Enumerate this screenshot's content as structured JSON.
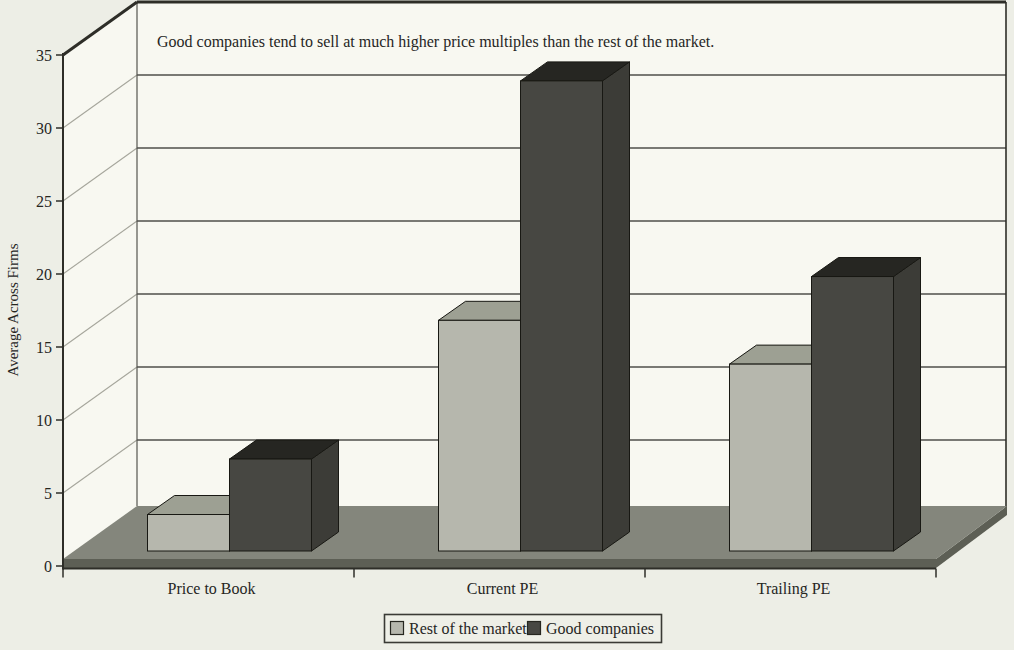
{
  "chart_data": {
    "type": "bar",
    "variant": "3d-clustered-column",
    "title": "Good companies tend to sell at much higher price multiples than the rest of the market.",
    "ylabel": "Average Across Firms",
    "xlabel": "",
    "categories": [
      "Price to Book",
      "Current PE",
      "Trailing PE"
    ],
    "series": [
      {
        "name": "Rest of the market",
        "values": [
          2.5,
          15.8,
          12.8
        ],
        "color_front": "#b6b7ad",
        "color_top": "#9da093",
        "color_side": "#8f9287"
      },
      {
        "name": "Good companies",
        "values": [
          6.3,
          32.2,
          18.8
        ],
        "color_front": "#474742",
        "color_top": "#262622",
        "color_side": "#3c3c37"
      }
    ],
    "ylim": [
      0,
      35
    ],
    "ytick_step": 5,
    "yticks": [
      0,
      5,
      10,
      15,
      20,
      25,
      30,
      35
    ],
    "grid": true,
    "legend_position": "bottom"
  },
  "colors": {
    "background": "#edeee6",
    "wall": "#f8f8f1",
    "gridline": "#4f4f4a",
    "wall_diagonal": "#a6a69c",
    "wall_edge": "#2e2e28",
    "wall_left_edge": "#55554f",
    "floor_top": "#84867c",
    "floor_side": "#5d5f55",
    "axis": "#2e2e28",
    "bar_outline": "#181813",
    "text": "#26261f",
    "legend_fill": "#eeefe7",
    "legend_border": "#3a3a35"
  }
}
